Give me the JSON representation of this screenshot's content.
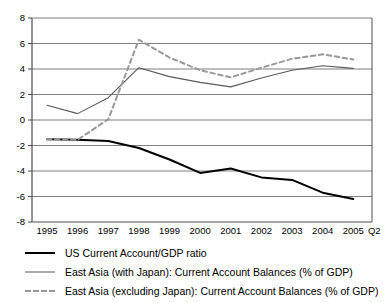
{
  "chart_data": {
    "type": "line",
    "title": "",
    "subtitle": "",
    "xlabel": "",
    "ylabel": "",
    "ylim": [
      -8,
      8
    ],
    "ytick_labels": [
      "8",
      "6",
      "4",
      "2",
      "0",
      "-2",
      "-4",
      "-6",
      "-8"
    ],
    "ytick_values": [
      8,
      6,
      4,
      2,
      0,
      -2,
      -4,
      -6,
      -8
    ],
    "grid": true,
    "grid_axis": "y",
    "legend_position": "below",
    "categories": [
      "1995",
      "1996",
      "1997",
      "1998",
      "1999",
      "2000",
      "2001",
      "2002",
      "2003",
      "2004",
      "2005 Q2"
    ],
    "xtick_labels": [
      "1995",
      "1996",
      "1997",
      "1998",
      "1999",
      "2000",
      "2001",
      "2002",
      "2003",
      "2004",
      "2005",
      "Q2"
    ],
    "series": [
      {
        "name": "US Current Account/GDP ratio",
        "style": "solid",
        "color": "#000000",
        "width": 2.0,
        "values": [
          -1.5,
          -1.55,
          -1.65,
          -2.2,
          -3.1,
          -4.15,
          -3.8,
          -4.5,
          -4.7,
          -5.7,
          -6.2
        ]
      },
      {
        "name": "East Asia (with Japan): Current Account Balances (% of GDP)",
        "style": "solid",
        "color": "#595959",
        "width": 1.1,
        "values": [
          1.15,
          0.5,
          1.75,
          4.1,
          3.4,
          2.95,
          2.6,
          3.3,
          3.9,
          4.25,
          4.05
        ]
      },
      {
        "name": "East Asia (excluding Japan): Current Account Balances (% of GDP)",
        "style": "dashed",
        "color": "#999999",
        "width": 2.0,
        "values": [
          -1.5,
          -1.55,
          0.05,
          6.3,
          4.9,
          3.9,
          3.35,
          4.1,
          4.8,
          5.15,
          4.75
        ]
      }
    ],
    "annotations": []
  },
  "legend": {
    "items": [
      {
        "label": "US Current Account/GDP ratio",
        "swatch": "solid-black-line-swatch"
      },
      {
        "label": "East Asia (with Japan): Current Account Balances (% of GDP)",
        "swatch": "solid-gray-line-swatch"
      },
      {
        "label": "East Asia (excluding Japan): Current Account Balances (% of GDP)",
        "swatch": "dashed-gray-line-swatch"
      }
    ]
  },
  "colors": {
    "background": "#ffffff",
    "axis": "#4d4d4d",
    "grid": "#7f7f7f",
    "series_us": "#000000",
    "series_east_asia_with_japan": "#595959",
    "series_east_asia_excluding_japan": "#999999"
  }
}
